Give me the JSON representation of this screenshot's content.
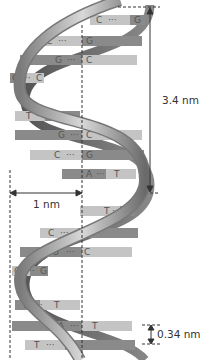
{
  "diagram": {
    "labels": {
      "pitch": "3.4 nm",
      "diameter": "1 nm",
      "rise": "0.34 nm"
    },
    "base_pairs": [
      {
        "left": "C",
        "right": "G",
        "y": 20
      },
      {
        "left": "C",
        "right": "G",
        "y": 41
      },
      {
        "left": "G",
        "right": "C",
        "y": 60
      },
      {
        "left": "G",
        "right": "C",
        "y": 78
      },
      {
        "left": "T",
        "right": "A",
        "y": 116
      },
      {
        "left": "G",
        "right": "C",
        "y": 135
      },
      {
        "left": "C",
        "right": "G",
        "y": 155
      },
      {
        "left": "A",
        "right": "T",
        "y": 174
      },
      {
        "left": "T",
        "right": "A",
        "y": 211
      },
      {
        "left": "C",
        "right": "G",
        "y": 233
      },
      {
        "left": "G",
        "right": "C",
        "y": 252
      },
      {
        "left": "C",
        "right": "G",
        "y": 271
      },
      {
        "left": "A",
        "right": "T",
        "y": 305
      },
      {
        "left": "A",
        "right": "T",
        "y": 326
      },
      {
        "left": "T",
        "right": "A",
        "y": 345
      }
    ],
    "colors": {
      "backbone_light": "#c8c8c8",
      "backbone_dark": "#6e6e6e",
      "base_dark": "#8a8a8a",
      "base_light": "#c4c4c4",
      "text": "#333333"
    }
  }
}
